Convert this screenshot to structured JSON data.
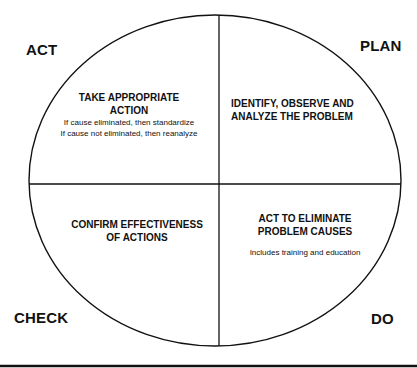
{
  "diagram": {
    "type": "PDCA cycle",
    "colors": {
      "stroke": "#111111",
      "background": "#ffffff",
      "text": "#111111"
    },
    "corners": {
      "act": "ACT",
      "plan": "PLAN",
      "check": "CHECK",
      "do": "DO"
    },
    "quadrants": {
      "act": {
        "title_line1": "TAKE APPROPRIATE",
        "title_line2": "ACTION",
        "detail_line1": "If cause eliminated, then standardize",
        "detail_line2": "If cause not eliminated, then reanalyze"
      },
      "plan": {
        "title_line1": "IDENTIFY, OBSERVE AND",
        "title_line2": "ANALYZE THE PROBLEM"
      },
      "check": {
        "title_line1": "CONFIRM EFFECTIVENESS",
        "title_line2": "OF ACTIONS"
      },
      "do": {
        "title_line1": "ACT TO ELIMINATE",
        "title_line2": "PROBLEM CAUSES",
        "detail_line1": "Includes training and education"
      }
    }
  }
}
